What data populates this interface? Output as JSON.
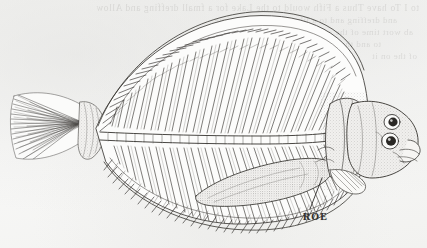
{
  "page": {
    "kind": "scanned-book-illustration",
    "width": 427,
    "height": 248,
    "paper_color": "#f6f6f5",
    "ink_color": "#2f2d2b"
  },
  "illustration": {
    "subject": "flatfish-flounder-lateral-anatomy",
    "technique": "pen-and-ink line engraving with stipple shading",
    "orientation": "head at right, tail at left",
    "parts": [
      {
        "name": "caudal-fin",
        "label": "caudal fin"
      },
      {
        "name": "caudal-peduncle",
        "label": "caudal peduncle"
      },
      {
        "name": "dorsal-fin",
        "label": "dorsal fin"
      },
      {
        "name": "anal-fin",
        "label": "anal fin"
      },
      {
        "name": "vertebral-column",
        "label": "vertebral column"
      },
      {
        "name": "dorsal-pterygiophores",
        "label": "dorsal fin rays"
      },
      {
        "name": "ventral-pterygiophores",
        "label": "anal fin rays"
      },
      {
        "name": "roe-mass",
        "label": "roe"
      },
      {
        "name": "operculum",
        "label": "gill cover"
      },
      {
        "name": "pectoral-fin",
        "label": "pectoral fin"
      },
      {
        "name": "upper-eye",
        "label": "upper eye"
      },
      {
        "name": "lower-eye",
        "label": "lower eye"
      },
      {
        "name": "mouth",
        "label": "mouth"
      }
    ]
  },
  "annotations": {
    "roe": {
      "text": "ROE",
      "leader_from": {
        "x": 310,
        "y": 209
      },
      "leader_to": {
        "x": 322,
        "y": 178
      }
    }
  },
  "bleed_through": {
    "description": "faint mirrored show-through text from the reverse page",
    "visible": true,
    "lines": [
      "to I To have Thus a Fifh would  to the Lake  for  a fmall  dreffing and Allow",
      "and dreffing and to a like  of the  a lefter  time",
      "ab wort time of the  and in a  the eyes  and the  fish",
      "to and the  of the  to  them  be  one  the  Wafer",
      "of the  on it"
    ]
  }
}
